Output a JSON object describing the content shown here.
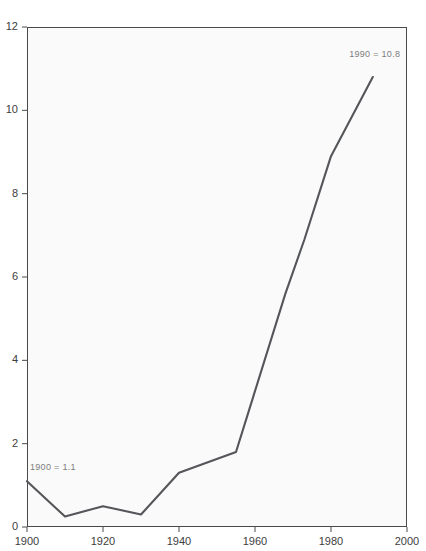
{
  "chart_data": {
    "type": "line",
    "title": "",
    "xlabel": "",
    "ylabel": "",
    "xlim": [
      1900,
      2000
    ],
    "ylim": [
      0,
      12
    ],
    "grid": false,
    "legend": null,
    "xticks": [
      "1900",
      "1920",
      "1940",
      "1960",
      "1980",
      "2000"
    ],
    "xtick_values": [
      1900,
      1920,
      1940,
      1960,
      1980,
      2000
    ],
    "yticks": [
      "0",
      "2",
      "4",
      "6",
      "8",
      "10",
      "12"
    ],
    "ytick_values": [
      0,
      2,
      4,
      6,
      8,
      10,
      12
    ],
    "series": [
      {
        "name": "value",
        "x": [
          1900,
          1910,
          1920,
          1930,
          1940,
          1955,
          1968,
          1973,
          1980,
          1991
        ],
        "values": [
          1.1,
          0.25,
          0.5,
          0.3,
          1.3,
          1.8,
          5.6,
          6.9,
          8.9,
          10.8
        ]
      }
    ],
    "annotations": [
      {
        "text": "1900 = 1.1",
        "x": 1900,
        "y": 1.45
      },
      {
        "text": "1990 = 10.8",
        "x": 1984,
        "y": 11.35
      }
    ],
    "colors": {
      "line": "#55565a",
      "plot_background": "#fafafa",
      "frame": "#4a4a4a",
      "tick_label": "#3d3d3d",
      "annotation": "#7d7d7d",
      "page_background": "#ffffff"
    }
  }
}
